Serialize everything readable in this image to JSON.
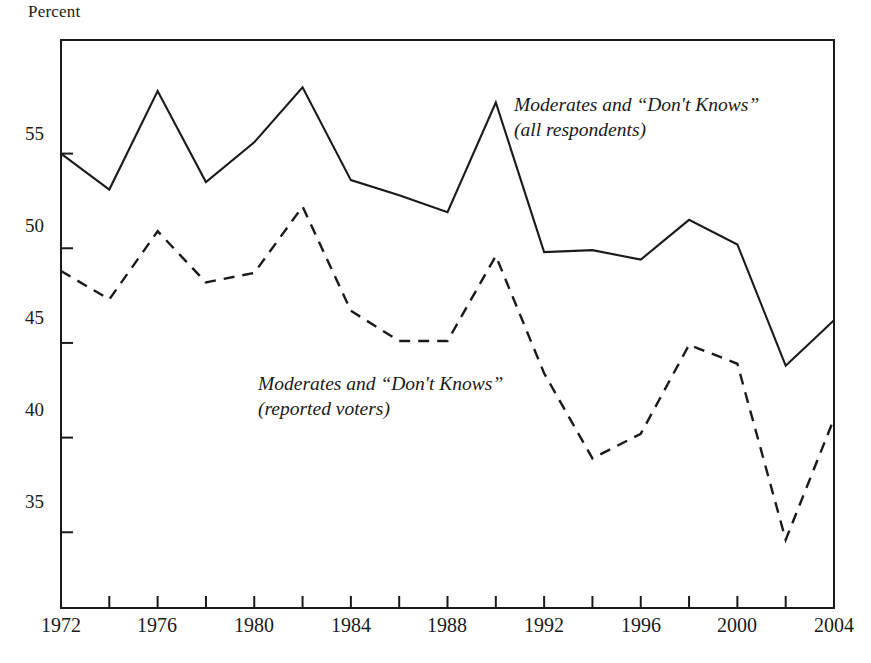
{
  "chart_data": {
    "type": "line",
    "title": "",
    "ylabel": "Percent",
    "xlabel": "",
    "xlim": [
      1972,
      2004
    ],
    "ylim": [
      31.0,
      61.0
    ],
    "grid": false,
    "legend_position": "inline-annotations",
    "x": [
      1972,
      1974,
      1976,
      1978,
      1980,
      1982,
      1984,
      1986,
      1988,
      1990,
      1992,
      1994,
      1996,
      1998,
      2000,
      2002,
      2004
    ],
    "y_ticks": [
      35,
      40,
      45,
      50,
      55
    ],
    "y_tick_labels": [
      "35",
      "40",
      "45",
      "50",
      "55"
    ],
    "x_ticks": [
      1972,
      1974,
      1976,
      1978,
      1980,
      1982,
      1984,
      1986,
      1988,
      1990,
      1992,
      1994,
      1996,
      1998,
      2000,
      2002,
      2004
    ],
    "x_tick_labels_shown": [
      "1972",
      "1976",
      "1980",
      "1984",
      "1988",
      "1992",
      "1996",
      "2000",
      "2004"
    ],
    "series": [
      {
        "name": "Moderates and “Don't Knows” (all respondents)",
        "style": "solid",
        "color": "#1a1a1a",
        "values": [
          55.0,
          53.1,
          58.3,
          53.5,
          55.6,
          58.5,
          53.6,
          52.8,
          51.9,
          57.7,
          49.8,
          49.9,
          49.4,
          51.5,
          50.2,
          43.8,
          46.2
        ]
      },
      {
        "name": "Moderates and “Don't Knows” (reported voters)",
        "style": "dashed",
        "color": "#1a1a1a",
        "values": [
          48.8,
          47.3,
          50.9,
          48.2,
          48.7,
          52.2,
          46.7,
          45.1,
          45.1,
          49.6,
          43.4,
          38.9,
          40.2,
          44.9,
          43.9,
          34.6,
          41.0
        ]
      }
    ],
    "annotations": [
      {
        "id": "all-respondents",
        "line1": "Moderates and “Don't Knows”",
        "line2": "(all respondents)",
        "x_px": 514,
        "y_px": 93
      },
      {
        "id": "reported-voters",
        "line1": "Moderates and “Don't Knows”",
        "line2": "(reported voters)",
        "x_px": 258,
        "y_px": 372
      }
    ]
  }
}
